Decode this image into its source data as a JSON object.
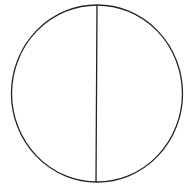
{
  "diagram": {
    "shape": "circle-bisected-vertically",
    "stroke_color": "#222222",
    "background_color": "#ffffff",
    "circle": {
      "cx": 97,
      "cy": 93.5,
      "rx": 85.5,
      "ry": 88.5
    },
    "divider": {
      "x1": 97,
      "y1": 5,
      "x2": 96,
      "y2": 182
    }
  }
}
